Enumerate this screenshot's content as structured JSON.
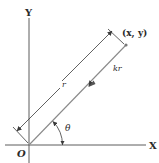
{
  "diagram": {
    "axes": {
      "x_label": "X",
      "y_label": "Y",
      "origin_label": "O"
    },
    "point_label": "(x, y)",
    "length_label": "r",
    "force_label": "kr",
    "angle_label": "θ",
    "colors": {
      "axis": "#4a4a4a",
      "rod": "#8a8a8a",
      "text": "#2a2a2a",
      "point": "#7a7a7a"
    }
  }
}
